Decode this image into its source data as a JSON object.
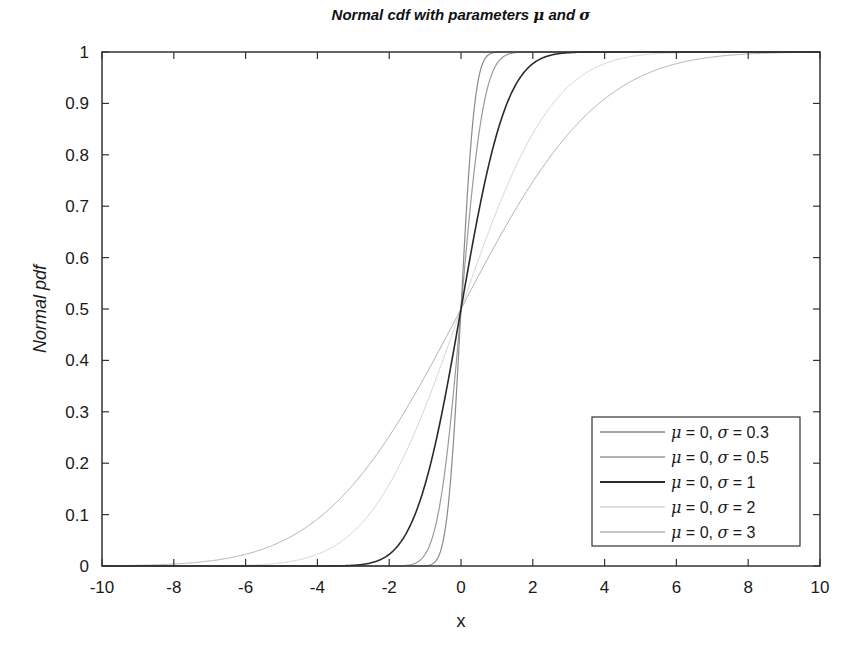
{
  "chart_data": {
    "type": "line",
    "title_prefix": "Normal cdf with parameters ",
    "title_mu": "μ",
    "title_and": " and ",
    "title_sigma": "σ",
    "title": "Normal cdf with parameters μ and σ",
    "xlabel": "x",
    "ylabel": "Normal pdf",
    "xlim": [
      -10,
      10
    ],
    "ylim": [
      0,
      1
    ],
    "xticks": [
      -10,
      -8,
      -6,
      -4,
      -2,
      0,
      2,
      4,
      6,
      8,
      10
    ],
    "xtick_labels": [
      "-10",
      "-8",
      "-6",
      "-4",
      "-2",
      "0",
      "2",
      "4",
      "6",
      "8",
      "10"
    ],
    "yticks": [
      0,
      0.1,
      0.2,
      0.3,
      0.4,
      0.5,
      0.6,
      0.7,
      0.8,
      0.9,
      1
    ],
    "ytick_labels": [
      "0",
      "0.1",
      "0.2",
      "0.3",
      "0.4",
      "0.5",
      "0.6",
      "0.7",
      "0.8",
      "0.9",
      "1"
    ],
    "grid": false,
    "legend_position": "lower right",
    "series": [
      {
        "name": "μ = 0, σ = 0.3",
        "mu": 0,
        "sigma": 0.3,
        "color": "#8a8a8a",
        "width": 1.2,
        "label_mu": "μ",
        "label_rest1": " = 0, ",
        "label_sigma": "σ",
        "label_rest2": " = 0.3"
      },
      {
        "name": "μ = 0, σ = 0.5",
        "mu": 0,
        "sigma": 0.5,
        "color": "#9a9a9a",
        "width": 1.2,
        "label_mu": "μ",
        "label_rest1": " = 0, ",
        "label_sigma": "σ",
        "label_rest2": " = 0.5"
      },
      {
        "name": "μ = 0, σ = 1",
        "mu": 0,
        "sigma": 1,
        "color": "#2a2a2a",
        "width": 1.6,
        "label_mu": "μ",
        "label_rest1": " = 0, ",
        "label_sigma": "σ",
        "label_rest2": " = 1"
      },
      {
        "name": "μ = 0, σ = 2",
        "mu": 0,
        "sigma": 2,
        "color": "#d6d6d6",
        "width": 1.0,
        "label_mu": "μ",
        "label_rest1": " = 0, ",
        "label_sigma": "σ",
        "label_rest2": " = 2"
      },
      {
        "name": "μ = 0, σ = 3",
        "mu": 0,
        "sigma": 3,
        "color": "#b0b0b0",
        "width": 1.0,
        "label_mu": "μ",
        "label_rest1": " = 0, ",
        "label_sigma": "σ",
        "label_rest2": " = 3"
      }
    ],
    "sample_x": [
      -10,
      -8,
      -6,
      -4,
      -3,
      -2,
      -1.5,
      -1,
      -0.5,
      0,
      0.5,
      1,
      1.5,
      2,
      3,
      4,
      6,
      8,
      10
    ],
    "sample_values": {
      "sigma_0.3": [
        0,
        0,
        0,
        0,
        0,
        0,
        3e-07,
        0.0004,
        0.048,
        0.5,
        0.952,
        0.9996,
        1,
        1,
        1,
        1,
        1,
        1,
        1
      ],
      "sigma_0.5": [
        0,
        0,
        0,
        0,
        1e-09,
        3e-05,
        0.0013,
        0.023,
        0.159,
        0.5,
        0.841,
        0.977,
        0.9987,
        0.99997,
        1,
        1,
        1,
        1,
        1
      ],
      "sigma_1": [
        0,
        0,
        1e-09,
        3e-05,
        0.0013,
        0.023,
        0.067,
        0.159,
        0.309,
        0.5,
        0.691,
        0.841,
        0.933,
        0.977,
        0.9987,
        0.99997,
        1,
        1,
        1
      ],
      "sigma_2": [
        3e-07,
        3e-05,
        0.0013,
        0.023,
        0.067,
        0.159,
        0.227,
        0.309,
        0.401,
        0.5,
        0.599,
        0.691,
        0.773,
        0.841,
        0.933,
        0.977,
        0.9987,
        0.99997,
        1
      ],
      "sigma_3": [
        0.0004,
        0.0038,
        0.023,
        0.091,
        0.159,
        0.252,
        0.309,
        0.369,
        0.434,
        0.5,
        0.566,
        0.631,
        0.691,
        0.748,
        0.841,
        0.909,
        0.977,
        0.9962,
        0.9996
      ]
    }
  }
}
